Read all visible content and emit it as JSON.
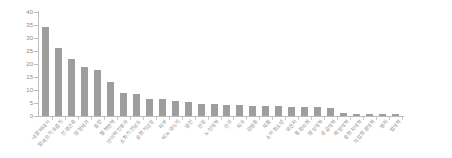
{
  "chart_data": {
    "type": "bar",
    "title": "",
    "subtitle": "",
    "xlabel": "",
    "ylabel": "",
    "ylim": [
      0,
      40
    ],
    "yticks": [
      0,
      5,
      10,
      15,
      20,
      25,
      30,
      35,
      40
    ],
    "grid": false,
    "legend": null,
    "bar_color": "#9e9e9e",
    "axis_color": "#bdbdbd",
    "text_color": "#8a8a8a",
    "orientation": "vertical",
    "sorted": "descending",
    "categories": [
      "내분비대사",
      "알레르기호흡기",
      "신경근육",
      "정형외과",
      "종양",
      "혈액면역",
      "안이비인후과",
      "소화기간담도",
      "순환기심장",
      "피부",
      "비뇨생식기",
      "정신",
      "신장",
      "노인의학",
      "산과",
      "치과",
      "감염증",
      "재활",
      "소아청소년",
      "유전자",
      "통증마취",
      "영상의학",
      "응급의학",
      "예방의학",
      "중환자의학",
      "직업환경의학",
      "병리",
      "법의학"
    ],
    "values": [
      34.3,
      26.0,
      22.1,
      18.8,
      17.7,
      13.0,
      9.0,
      8.3,
      6.5,
      6.4,
      5.8,
      5.4,
      4.8,
      4.7,
      4.4,
      4.1,
      4.0,
      3.9,
      3.8,
      3.6,
      3.5,
      3.4,
      3.2,
      1.0,
      0.9,
      0.8,
      0.7,
      0.6
    ]
  }
}
